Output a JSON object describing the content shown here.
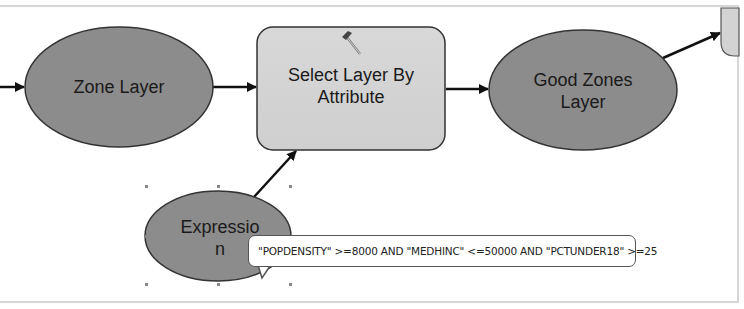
{
  "diagram": {
    "type": "model-builder-workflow",
    "nodes": [
      {
        "id": "zone-layer",
        "label": "Zone Layer",
        "shape": "ellipse",
        "kind": "data"
      },
      {
        "id": "select-layer-by-attribute",
        "label_line1": "Select Layer By",
        "label_line2": "Attribute",
        "shape": "rounded-rectangle",
        "kind": "tool",
        "icon": "hammer-icon"
      },
      {
        "id": "good-zones-layer",
        "label_line1": "Good Zones",
        "label_line2": "Layer",
        "shape": "ellipse",
        "kind": "data"
      },
      {
        "id": "expression",
        "label_line1": "Expressio",
        "label_line2": "n",
        "shape": "ellipse",
        "kind": "variable",
        "selected": true
      },
      {
        "id": "next-tool-partial",
        "label": "",
        "shape": "rounded-rectangle",
        "kind": "tool",
        "partially_visible": true
      }
    ],
    "edges": [
      {
        "from": "off-canvas-left",
        "to": "zone-layer"
      },
      {
        "from": "zone-layer",
        "to": "select-layer-by-attribute"
      },
      {
        "from": "select-layer-by-attribute",
        "to": "good-zones-layer"
      },
      {
        "from": "expression",
        "to": "select-layer-by-attribute"
      },
      {
        "from": "good-zones-layer",
        "to": "next-tool-partial"
      }
    ],
    "tooltip": {
      "text": "\"POPDENSITY\" >=8000 AND \"MEDHINC\" <=50000 AND \"PCTUNDER18\" >=25"
    },
    "colors": {
      "data_ellipse_fill": "#8c8c8c",
      "tool_box_fill": "#d3d3d3",
      "outline": "#333333",
      "connector": "#111111",
      "canvas_border": "#d6d6d6"
    }
  }
}
